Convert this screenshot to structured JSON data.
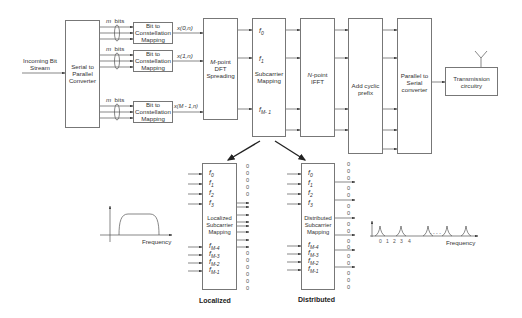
{
  "diagram": {
    "input": {
      "label_line1": "Incoming Bit",
      "label_line2": "Stream"
    },
    "blocks": {
      "serial_to_parallel": {
        "line1": "Serial to",
        "line2": "Parallel",
        "line3": "Converter"
      },
      "bit_to_constellation": [
        {
          "line1": "Bit to",
          "line2": "Constellation",
          "line3": "Mapping",
          "group_label_m": "m",
          "group_label_bits": "bits",
          "output": "x(0,n)"
        },
        {
          "line1": "Bit to",
          "line2": "Constellation",
          "line3": "Mapping",
          "group_label_m": "m",
          "group_label_bits": "bits",
          "output": "x(1,n)"
        },
        {
          "line1": "Bit to",
          "line2": "Constellation",
          "line3": "Mapping",
          "group_label_m": "m",
          "group_label_bits": "bits",
          "output": "x(M - 1,n)"
        }
      ],
      "dft_spreading": {
        "line1_italic": "M",
        "line1_rest": "-point",
        "line2": "DFT",
        "line3": "Spreading"
      },
      "subcarrier_mapping": {
        "line1": "Subcarrier",
        "line2": "Mapping",
        "f0": "f",
        "f0_sub": "0",
        "f1": "f",
        "f1_sub": "1",
        "fM1": "f",
        "fM1_sub": "M- 1"
      },
      "ifft": {
        "line1_italic": "N",
        "line1_rest": "-point",
        "line2": "IFFT"
      },
      "cyclic_prefix": {
        "line1": "Add cyclic",
        "line2": "prefix"
      },
      "parallel_to_serial": {
        "line1": "Parallel to",
        "line2": "Serial",
        "line3": "converter"
      },
      "transmission": {
        "line1": "Transmission",
        "line2": "circuitry"
      }
    },
    "localized": {
      "caption": "Localized",
      "block_line1": "Localized",
      "block_line2": "Subcarrier",
      "block_line3": "Mapping",
      "inputs": [
        {
          "f": "f",
          "sub": "0"
        },
        {
          "f": "f",
          "sub": "1"
        },
        {
          "f": "f",
          "sub": "2"
        },
        {
          "f": "f",
          "sub": "3"
        },
        {
          "f": "f",
          "sub": "M-4"
        },
        {
          "f": "f",
          "sub": "M-3"
        },
        {
          "f": "f",
          "sub": "M-2"
        },
        {
          "f": "f",
          "sub": "M-1"
        }
      ],
      "zero": "0",
      "spectrum_label": "Frequency"
    },
    "distributed": {
      "caption": "Distributed",
      "block_line1": "Distributed",
      "block_line2": "Subcarrier",
      "block_line3": "Mapping",
      "inputs": [
        {
          "f": "f",
          "sub": "0"
        },
        {
          "f": "f",
          "sub": "1"
        },
        {
          "f": "f",
          "sub": "2"
        },
        {
          "f": "f",
          "sub": "3"
        },
        {
          "f": "f",
          "sub": "M-4"
        },
        {
          "f": "f",
          "sub": "M-3"
        },
        {
          "f": "f",
          "sub": "M-2"
        },
        {
          "f": "f",
          "sub": "M-1"
        }
      ],
      "zero": "0",
      "spectrum_label": "Frequency",
      "spectrum_ticks": [
        "0",
        "1",
        "2",
        "3",
        "4"
      ],
      "spectrum_ellipsis": "- - - -"
    },
    "colors": {
      "line": "#555555",
      "box_border": "#777777",
      "text": "#333333",
      "big_arrow": "#222222"
    }
  }
}
